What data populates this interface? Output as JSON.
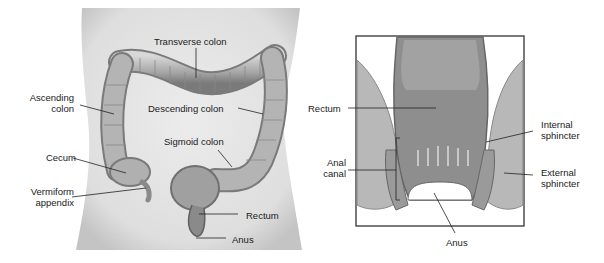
{
  "left_panel": {
    "title": "Large intestine (anterior view)",
    "labels": {
      "transverse_colon": "Transverse colon",
      "ascending_colon_1": "Ascending",
      "ascending_colon_2": "colon",
      "descending_colon": "Descending colon",
      "sigmoid_colon": "Sigmoid colon",
      "cecum": "Cecum",
      "vermiform_appendix_1": "Vermiform",
      "vermiform_appendix_2": "appendix",
      "rectum": "Rectum",
      "anus": "Anus"
    }
  },
  "right_panel": {
    "title": "Rectum and anal canal (cross-section)",
    "labels": {
      "rectum": "Rectum",
      "anal_canal_1": "Anal",
      "anal_canal_2": "canal",
      "internal_sphincter_1": "Internal",
      "internal_sphincter_2": "sphincter",
      "external_sphincter_1": "External",
      "external_sphincter_2": "sphincter",
      "anus": "Anus"
    }
  },
  "colors": {
    "torso": "#e4e4e4",
    "torso_shadow": "#c8c8c8",
    "colon": "#a8a8a8",
    "colon_light": "#d0d0d0",
    "colon_dark": "#6e6e6e",
    "frame": "#222222",
    "leader": "#222222"
  }
}
